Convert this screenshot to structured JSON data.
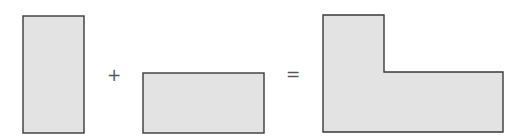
{
  "diagram": {
    "operators": {
      "plus": "+",
      "equals": "="
    },
    "shapes": [
      {
        "id": "tall-rectangle",
        "kind": "rectangle",
        "orientation": "vertical"
      },
      {
        "id": "wide-rectangle",
        "kind": "rectangle",
        "orientation": "horizontal"
      },
      {
        "id": "l-shape",
        "kind": "composite",
        "orientation": "L"
      }
    ],
    "colors": {
      "fill": "#e3e3e3",
      "stroke": "#3a3a3a",
      "operator": "#555555"
    }
  }
}
